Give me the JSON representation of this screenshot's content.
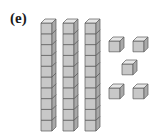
{
  "figure": {
    "label": "(e)",
    "value_represented": 35
  },
  "blocks": {
    "rods": [
      {
        "x": 41,
        "y": 19
      },
      {
        "x": 63,
        "y": 19
      },
      {
        "x": 85,
        "y": 19
      }
    ],
    "cubes_per_rod": 10,
    "units": [
      {
        "x": 109,
        "y": 41
      },
      {
        "x": 133,
        "y": 41
      },
      {
        "x": 122,
        "y": 64
      },
      {
        "x": 109,
        "y": 88
      },
      {
        "x": 133,
        "y": 88
      }
    ]
  },
  "colors": {
    "front": "#c8c8c8",
    "top": "#e6e6e6",
    "side": "#a9a9a9",
    "stroke": "#5a5a5a"
  }
}
